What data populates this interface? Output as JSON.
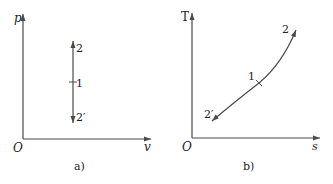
{
  "panels": [
    {
      "id": "a",
      "caption": "a)",
      "origin_label": "O",
      "y_axis_label": "p",
      "x_axis_label": "v",
      "points": [
        {
          "label": "2"
        },
        {
          "label": "1"
        },
        {
          "label": "2′"
        }
      ]
    },
    {
      "id": "b",
      "caption": "b)",
      "origin_label": "O",
      "y_axis_label": "T",
      "x_axis_label": "s",
      "points": [
        {
          "label": "2"
        },
        {
          "label": "1"
        },
        {
          "label": "2′"
        }
      ]
    }
  ],
  "colors": {
    "line": "#4a4a4a",
    "text": "#222222"
  }
}
